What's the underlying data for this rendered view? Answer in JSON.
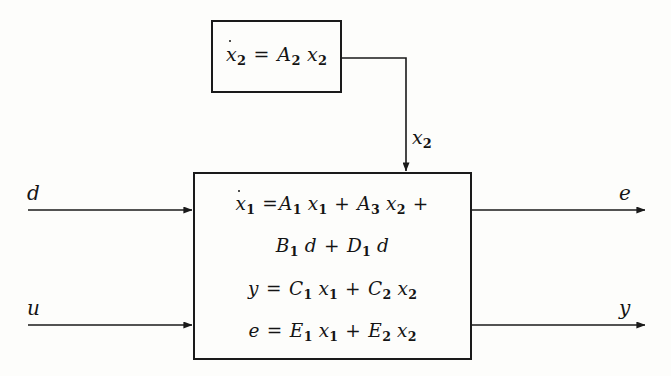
{
  "figure": {
    "type": "control-system-block-diagram",
    "background_color": "#fdfdfb",
    "line_color": "#1a1a1a",
    "text_color": "#141414"
  },
  "exosystem": {
    "name": "exosystem-block",
    "equation_plain": "x2dot = A2 x2",
    "lhs_var": "x",
    "lhs_sub": "2",
    "equals": "=",
    "rhs_coeff": "A",
    "rhs_coeff_sub": "2",
    "rhs_var": "x",
    "rhs_var_sub": "2"
  },
  "plant": {
    "name": "plant-block",
    "equations_plain": [
      "x1dot = A1 x1 + A3 x2 +",
      "B1 d + D1 d",
      "y = C1 x1 + C2 x2",
      "e = E1 x1 + E2 x2"
    ],
    "line1": {
      "lhs_var": "x",
      "lhs_sub": "1",
      "equals": "=",
      "t1_coeff": "A",
      "t1_coeff_sub": "1",
      "t1_var": "x",
      "t1_var_sub": "1",
      "plus1": "+",
      "t2_coeff": "A",
      "t2_coeff_sub": "3",
      "t2_var": "x",
      "t2_var_sub": "2",
      "plus2": "+"
    },
    "line2": {
      "t1_coeff": "B",
      "t1_coeff_sub": "1",
      "t1_var": "d",
      "plus": "+",
      "t2_coeff": "D",
      "t2_coeff_sub": "1",
      "t2_var": "d"
    },
    "line3": {
      "lhs_var": "y",
      "equals": "=",
      "t1_coeff": "C",
      "t1_coeff_sub": "1",
      "t1_var": "x",
      "t1_var_sub": "1",
      "plus": "+",
      "t2_coeff": "C",
      "t2_coeff_sub": "2",
      "t2_var": "x",
      "t2_var_sub": "2"
    },
    "line4": {
      "lhs_var": "e",
      "equals": "=",
      "t1_coeff": "E",
      "t1_coeff_sub": "1",
      "t1_var": "x",
      "t1_var_sub": "1",
      "plus": "+",
      "t2_coeff": "E",
      "t2_coeff_sub": "2",
      "t2_var": "x",
      "t2_var_sub": "2"
    }
  },
  "signals": {
    "input_disturbance": {
      "label": "d",
      "name": "signal-d"
    },
    "input_control": {
      "label": "u",
      "name": "signal-u"
    },
    "output_error": {
      "label": "e",
      "name": "signal-e"
    },
    "output_measurement": {
      "label": "y",
      "name": "signal-y"
    },
    "coupling_state": {
      "label": "x",
      "sub": "2",
      "name": "signal-x2"
    }
  }
}
